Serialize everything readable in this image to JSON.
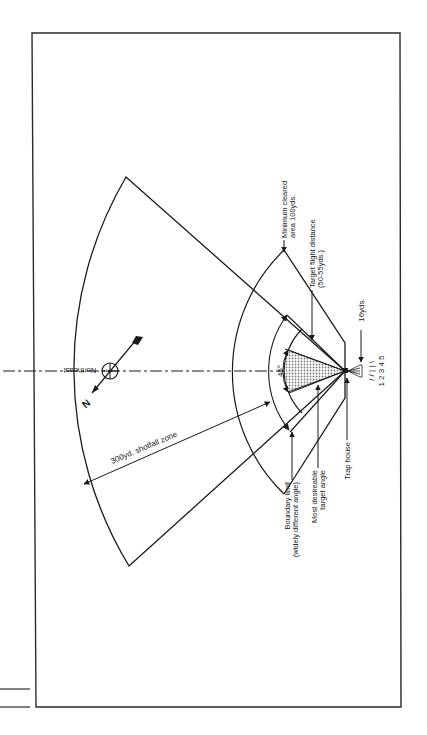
{
  "diagram": {
    "orientation": "rotated 90deg (trap house at right, shotfall to left)",
    "labels": {
      "minimum_cleared_line1": "Minimum cleared",
      "minimum_cleared_line2": "area 100yds.",
      "target_flight_line1": "Target flight distance",
      "target_flight_line2": "(50-55yds.)",
      "sixteen_yds": "16yds.",
      "station_numbers": "1 2 3 4 5",
      "trap_house": "Trap house",
      "most_desirable_line1": "Most desireable",
      "most_desirable_line2": "target angle",
      "boundary_line1": "Boundary limit",
      "boundary_line2": "(widely different angle)",
      "angle": "45°",
      "shotfall": "300yd. shotfall zone",
      "northeast": "Northeast",
      "north": "N"
    },
    "colors": {
      "line": "#1a1a1a",
      "background": "#ffffff",
      "shade": "#9a9a9a"
    }
  }
}
